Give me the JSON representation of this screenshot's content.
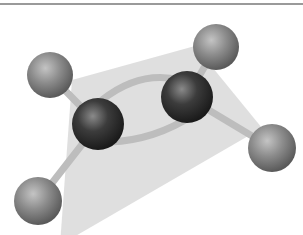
{
  "figure": {
    "molecular_plane_color": "#dcdcdc",
    "carbon_color": "#3c3c3c",
    "hydrogen_color": "#8c8c8c",
    "bond_color": "#c8c8c8",
    "atoms": [
      {
        "element": "H",
        "x": 50,
        "y": 75,
        "r": 23
      },
      {
        "element": "H",
        "x": 216,
        "y": 47,
        "r": 23
      },
      {
        "element": "C",
        "x": 98,
        "y": 124,
        "r": 26
      },
      {
        "element": "C",
        "x": 187,
        "y": 97,
        "r": 26
      },
      {
        "element": "H",
        "x": 38,
        "y": 201,
        "r": 24
      },
      {
        "element": "H",
        "x": 272,
        "y": 148,
        "r": 24
      }
    ]
  }
}
